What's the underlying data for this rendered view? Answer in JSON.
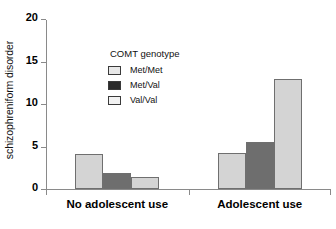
{
  "chart_data": {
    "type": "bar",
    "title": "",
    "xlabel": "",
    "ylabel": "schizophreniform disorder",
    "categories": [
      "No adolescent use",
      "Adolescent use"
    ],
    "series": [
      {
        "name": "Met/Met",
        "values": [
          4.1,
          4.2
        ],
        "color": "#d4d4d4"
      },
      {
        "name": "Met/Val",
        "values": [
          1.9,
          5.5
        ],
        "color": "#6e6e6e"
      },
      {
        "name": "Val/Val",
        "values": [
          1.4,
          12.9
        ],
        "color": "#d4d4d4"
      }
    ],
    "legend_title": "COMT genotype",
    "legend_position": "inside-upper-left",
    "ylim": [
      0,
      20
    ],
    "yticks": [
      0,
      5,
      10,
      15,
      20
    ],
    "ytick_labels": [
      "0",
      "5",
      "10",
      "15",
      "20"
    ],
    "grid": false
  },
  "axes": {
    "y_axis_label": "schizophreniform disorder",
    "y_tick_labels": [
      "20",
      "15",
      "10",
      "5",
      "0"
    ],
    "x_tick_labels": [
      "No adolescent use",
      "Adolescent use"
    ]
  },
  "legend": {
    "title": "COMT genotype",
    "items": [
      {
        "label": "Met/Met",
        "swatch": "#e8e8e8"
      },
      {
        "label": "Met/Val",
        "swatch": "#2b2b2b"
      },
      {
        "label": "Val/Val",
        "swatch": "#f2f2f2"
      }
    ]
  },
  "colors": {
    "bar_light": "#d4d4d4",
    "bar_dark": "#6e6e6e",
    "bar_edge": "#6f6f6f",
    "axis": "#8a8a8a",
    "text": "#111111"
  }
}
